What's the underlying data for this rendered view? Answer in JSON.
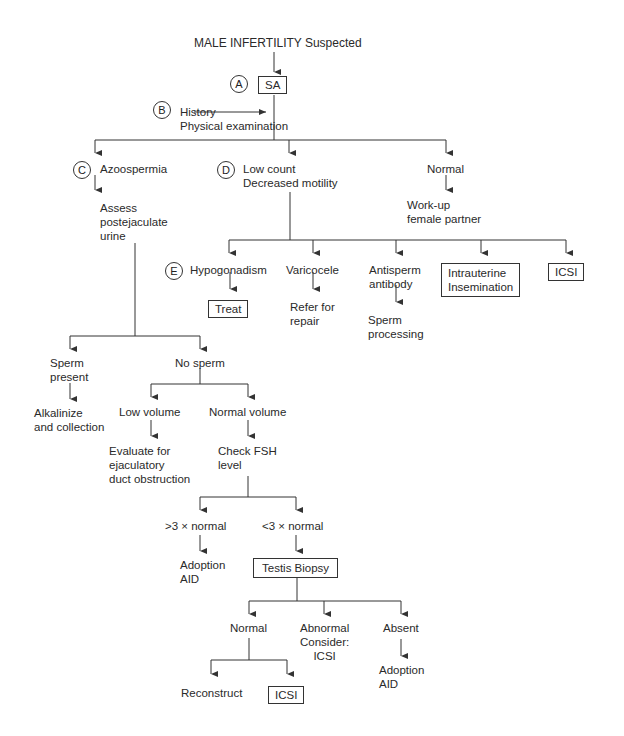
{
  "diagram": {
    "title": "MALE INFERTILITY Suspected",
    "nodes": {
      "sa": "SA",
      "history": "History\nPhysical examination",
      "azoospermia": "Azoospermia",
      "assess": "Assess\npostejaculate\nurine",
      "low_count": "Low count\nDecreased motility",
      "normal_top": "Normal",
      "workup": "Work-up\nfemale partner",
      "hypogonadism": "Hypogonadism",
      "treat": "Treat",
      "varicocele": "Varicocele",
      "refer": "Refer for\nrepair",
      "antisperm": "Antisperm\nantibody",
      "sperm_processing": "Sperm\nprocessing",
      "iui": "Intrauterine\nInsemination",
      "icsi_top": "ICSI",
      "sperm_present": "Sperm\npresent",
      "alkalinize": "Alkalinize\nand collection",
      "no_sperm": "No sperm",
      "low_volume": "Low volume",
      "evaluate": "Evaluate for\nejaculatory\nduct obstruction",
      "normal_volume": "Normal volume",
      "check_fsh": "Check FSH\nlevel",
      "gt3": ">3 × normal",
      "adoption1": "Adoption\nAID",
      "lt3": "<3 × normal",
      "biopsy": "Testis Biopsy",
      "normal_bottom": "Normal",
      "abnormal": "Abnormal\nConsider:\nICSI",
      "absent": "Absent",
      "adoption2": "Adoption\nAID",
      "reconstruct": "Reconstruct",
      "icsi_bottom": "ICSI"
    },
    "markers": {
      "a": "A",
      "b": "B",
      "c": "C",
      "d": "D",
      "e": "E"
    },
    "line_color": "#333333"
  }
}
